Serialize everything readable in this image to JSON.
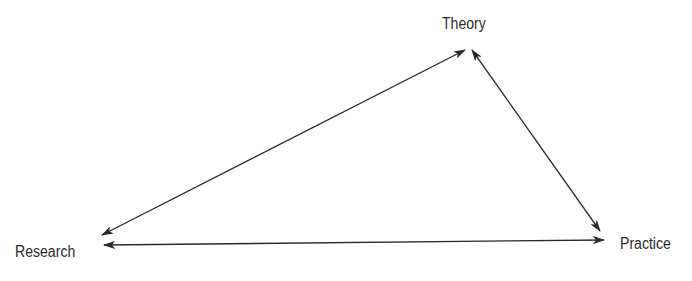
{
  "diagram": {
    "type": "triangle-relationship",
    "nodes": {
      "theory": {
        "label": "Theory"
      },
      "research": {
        "label": "Research"
      },
      "practice": {
        "label": "Practice"
      }
    },
    "edges": [
      {
        "from": "research",
        "to": "theory",
        "direction": "bidirectional"
      },
      {
        "from": "theory",
        "to": "practice",
        "direction": "bidirectional"
      },
      {
        "from": "research",
        "to": "practice",
        "direction": "bidirectional"
      }
    ],
    "colors": {
      "line": "#2a2a2a",
      "text": "#2a2a2a",
      "background": "#ffffff"
    }
  }
}
